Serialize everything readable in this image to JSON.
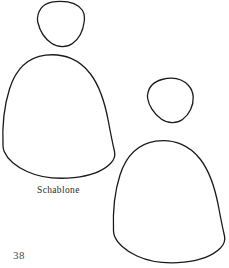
{
  "page": {
    "kind": "craft-pattern-template-page",
    "background_color": "#ffffff",
    "ink_color": "#1a1a1a",
    "width": 229,
    "height": 268
  },
  "caption": {
    "text": "Schablone"
  },
  "page_number": {
    "text": "38"
  },
  "shapes": [
    {
      "id": "head-left",
      "name": "small-head-template-left",
      "label": "small rounded head template, upper left",
      "stroke": "#1a1a1a",
      "stroke_width": 1.3,
      "fill": "none",
      "path": "M 37.5 18 C 38.5 9 44 2.5 55.5 1.6 C 69 0.6 78.5 4.5 82.5 10.5 C 84.5 13.5 84.8 17 84.2 21.5 C 83.2 30 79.5 38.5 72.5 43.5 C 66.5 47.8 58 47.6 51.5 43.2 C 44 38.1 39.5 29.5 37.9 22.5 C 37.6 21 37.4 19.5 37.5 18 Z"
    },
    {
      "id": "body-left",
      "name": "large-bell-template-left",
      "label": "large bell shaped body template, left",
      "stroke": "#1a1a1a",
      "stroke_width": 1.3,
      "fill": "none",
      "path": "M 3.0 146 C 2.2 128 3.5 108 9.5 89 C 15.5 70 27.5 57.5 45.5 55.2 C 64 52.8 80 60 90.5 74 C 100 86.5 105 103 108.5 122 C 111 135.5 113 145 114.5 151.5 C 115.5 156 114.5 159.5 110.5 163.5 C 103.5 170.5 90 176 74 177.6 C 56 179.4 40 177.5 27 171.5 C 15 166 7 158 4.2 151.5 C 3.5 149.8 3.1 148 3.0 146 Z"
    },
    {
      "id": "head-right",
      "name": "small-head-template-right",
      "label": "small rounded head template, middle right",
      "stroke": "#1a1a1a",
      "stroke_width": 1.3,
      "fill": "none",
      "path": "M 147.5 95.5 C 148.2 88.5 152.5 82 162 79.5 C 173.5 76.5 183 79.5 188.5 85.5 C 191.5 88.8 193 92.5 193.2 97 C 193.6 105.5 189.5 114.5 182.5 119.5 C 176.5 123.8 168 123.6 161.5 119.2 C 153.5 113.8 148.6 104.5 147.7 98.5 C 147.5 97.5 147.4 96.5 147.5 95.5 Z"
    },
    {
      "id": "body-right",
      "name": "large-bell-template-right",
      "label": "large bell shaped body template, lower right",
      "stroke": "#1a1a1a",
      "stroke_width": 1.3,
      "fill": "none",
      "path": "M 113.5 231 C 112.8 213 114 193.5 120 175 C 126 156.5 138 144 155.5 141.2 C 174 138.4 190 145.5 200.5 159.5 C 210 172 215 188 218.5 206.5 C 221 220 223 229.5 224.5 236 C 225.5 240.5 224.5 244 220.5 248 C 213.5 255 200 260.5 184 262.2 C 166 264 150 262 137 256 C 125 250.5 117 242.5 114.6 236.2 C 113.9 234.5 113.6 232.8 113.5 231 Z"
    }
  ]
}
